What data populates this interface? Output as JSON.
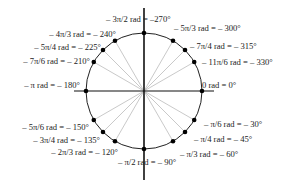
{
  "diagram": {
    "center": [
      144,
      91
    ],
    "radius": 58,
    "colors": {
      "axis": "#111111",
      "circle": "#222222",
      "ray": "#bbbbbb",
      "point": "#000000"
    },
    "points": [
      {
        "deg": 0,
        "label": "0 rad = 0°",
        "lx": 202,
        "ly": 88,
        "anchor": "start"
      },
      {
        "deg": -30,
        "label": "– π/6  rad = – 30°",
        "lx": 204,
        "ly": 127,
        "anchor": "start"
      },
      {
        "deg": -45,
        "label": "– π/4 rad = – 45°",
        "lx": 194,
        "ly": 142,
        "anchor": "start"
      },
      {
        "deg": -60,
        "label": "– π/3 rad = – 60°",
        "lx": 180,
        "ly": 157,
        "anchor": "start"
      },
      {
        "deg": -90,
        "label": "– π/2 rad = – 90°",
        "lx": 118,
        "ly": 165,
        "anchor": "start"
      },
      {
        "deg": -120,
        "label": "– 2π/3 rad = – 120°",
        "lx": 118,
        "ly": 155,
        "anchor": "end"
      },
      {
        "deg": -135,
        "label": "– 3π/4 rad = – 135°",
        "lx": 100,
        "ly": 143,
        "anchor": "end"
      },
      {
        "deg": -150,
        "label": "– 5π/6 rad = – 150°",
        "lx": 89,
        "ly": 130,
        "anchor": "end"
      },
      {
        "deg": -180,
        "label": "– π rad = – 180°",
        "lx": 80,
        "ly": 88,
        "anchor": "end"
      },
      {
        "deg": -210,
        "label": "– 7π/6 rad = – 210°",
        "lx": 90,
        "ly": 64,
        "anchor": "end"
      },
      {
        "deg": -225,
        "label": "– 5π/4 rad = – 225°",
        "lx": 101,
        "ly": 50,
        "anchor": "end"
      },
      {
        "deg": -240,
        "label": "– 4π/3 rad = – 240°",
        "lx": 116,
        "ly": 37,
        "anchor": "end"
      },
      {
        "deg": -270,
        "label": "– 3π/2 rad = –270°",
        "lx": 106,
        "ly": 22,
        "anchor": "start"
      },
      {
        "deg": -300,
        "label": "– 5π/3 rad = – 300°",
        "lx": 174,
        "ly": 31,
        "anchor": "start"
      },
      {
        "deg": -315,
        "label": "– 7π/4 rad = – 315°",
        "lx": 190,
        "ly": 49,
        "anchor": "start"
      },
      {
        "deg": -330,
        "label": "– 11π/6 rad = – 330°",
        "lx": 202,
        "ly": 65,
        "anchor": "start"
      }
    ]
  }
}
